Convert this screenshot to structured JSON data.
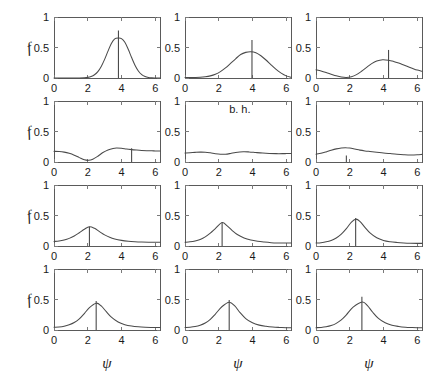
{
  "figure": {
    "width": 436,
    "height": 367,
    "background": "#ffffff",
    "curve_color": "#4a4a4a",
    "frame_color": "#5a5a5a",
    "rows": 4,
    "cols": 3
  },
  "axes": {
    "x_label": "ψ",
    "y_label": "f",
    "x_ticks": [
      0,
      2,
      4,
      6
    ],
    "x_tick_labels": [
      "0",
      "2",
      "4",
      "6"
    ],
    "y_ticks": [
      0,
      0.5,
      1
    ],
    "y_tick_labels": [
      "0",
      "0.5",
      "1"
    ],
    "xlim": [
      0,
      6.2832
    ],
    "ylim": [
      0,
      1
    ]
  },
  "chart_data": {
    "type": "line",
    "title": "",
    "xlabel": "ψ",
    "ylabel": "f",
    "xlim": [
      0,
      6.2832
    ],
    "ylim": [
      0,
      1
    ],
    "grid": false,
    "legend": null,
    "layout": {
      "rows": 4,
      "cols": 3,
      "shared_x": true,
      "shared_y": true
    },
    "panels": [
      {
        "row": 1,
        "col": 1,
        "annotation": "",
        "marker_line": {
          "x": 3.82,
          "y_top": 0.78
        },
        "peak": {
          "x": 3.82,
          "y": 0.655
        },
        "x": [
          0,
          0.3,
          0.6,
          0.9,
          1.2,
          1.5,
          1.8,
          2.0,
          2.2,
          2.4,
          2.6,
          2.8,
          3.0,
          3.2,
          3.4,
          3.6,
          3.82,
          4.0,
          4.2,
          4.4,
          4.6,
          4.8,
          5.0,
          5.2,
          5.4,
          5.6,
          5.8,
          6.0,
          6.2832
        ],
        "y": [
          0.0,
          0.0,
          0.0,
          0.0,
          0.0,
          0.001,
          0.004,
          0.01,
          0.024,
          0.053,
          0.105,
          0.19,
          0.305,
          0.44,
          0.565,
          0.64,
          0.655,
          0.645,
          0.585,
          0.47,
          0.335,
          0.21,
          0.115,
          0.055,
          0.024,
          0.009,
          0.003,
          0.001,
          0.0
        ]
      },
      {
        "row": 1,
        "col": 2,
        "annotation": "",
        "marker_line": {
          "x": 3.97,
          "y_top": 0.625
        },
        "peak": {
          "x": 3.9,
          "y": 0.43
        },
        "x": [
          0,
          0.3,
          0.6,
          0.9,
          1.2,
          1.5,
          1.8,
          2.1,
          2.4,
          2.7,
          3.0,
          3.3,
          3.6,
          3.9,
          4.2,
          4.5,
          4.8,
          5.1,
          5.4,
          5.7,
          6.0,
          6.2832
        ],
        "y": [
          0.008,
          0.008,
          0.009,
          0.012,
          0.02,
          0.035,
          0.062,
          0.105,
          0.165,
          0.24,
          0.315,
          0.385,
          0.42,
          0.43,
          0.415,
          0.365,
          0.295,
          0.215,
          0.14,
          0.08,
          0.035,
          0.014
        ]
      },
      {
        "row": 1,
        "col": 3,
        "annotation": "",
        "marker_line": {
          "x": 4.3,
          "y_top": 0.46
        },
        "peak": {
          "x": 3.95,
          "y": 0.3
        },
        "x": [
          0,
          0.3,
          0.6,
          0.9,
          1.2,
          1.5,
          1.8,
          2.1,
          2.4,
          2.7,
          3.0,
          3.3,
          3.6,
          3.95,
          4.3,
          4.6,
          4.9,
          5.2,
          5.5,
          5.8,
          6.0,
          6.2832
        ],
        "y": [
          0.135,
          0.115,
          0.09,
          0.062,
          0.035,
          0.015,
          0.008,
          0.02,
          0.055,
          0.11,
          0.175,
          0.235,
          0.278,
          0.3,
          0.292,
          0.272,
          0.245,
          0.213,
          0.18,
          0.148,
          0.13,
          0.112
        ]
      },
      {
        "row": 2,
        "col": 1,
        "annotation": "",
        "marker_line": {
          "x": 4.6,
          "y_top": 0.225
        },
        "peak": {
          "x": 3.7,
          "y": 0.228
        },
        "x": [
          0,
          0.3,
          0.6,
          0.9,
          1.2,
          1.5,
          1.8,
          2.05,
          2.3,
          2.6,
          2.9,
          3.2,
          3.5,
          3.7,
          4.0,
          4.3,
          4.6,
          4.9,
          5.2,
          5.5,
          5.8,
          6.0,
          6.2832
        ],
        "y": [
          0.175,
          0.172,
          0.162,
          0.142,
          0.112,
          0.072,
          0.035,
          0.027,
          0.045,
          0.095,
          0.155,
          0.198,
          0.222,
          0.228,
          0.224,
          0.212,
          0.203,
          0.196,
          0.19,
          0.186,
          0.183,
          0.182,
          0.18
        ]
      },
      {
        "row": 2,
        "col": 2,
        "annotation": "b. h.",
        "annotation_x": 3.25,
        "annotation_y": 0.8,
        "marker_line": null,
        "peak": {
          "x": 3.45,
          "y": 0.168
        },
        "x": [
          0,
          0.3,
          0.6,
          0.9,
          1.2,
          1.5,
          1.8,
          2.1,
          2.4,
          2.7,
          3.0,
          3.45,
          3.8,
          4.2,
          4.6,
          5.0,
          5.4,
          5.8,
          6.0,
          6.2832
        ],
        "y": [
          0.148,
          0.152,
          0.158,
          0.162,
          0.16,
          0.15,
          0.136,
          0.127,
          0.128,
          0.14,
          0.156,
          0.168,
          0.165,
          0.155,
          0.146,
          0.14,
          0.137,
          0.137,
          0.138,
          0.14
        ]
      },
      {
        "row": 2,
        "col": 3,
        "annotation": "",
        "marker_line": {
          "x": 1.8,
          "y_top": 0.105
        },
        "peak": {
          "x": 1.75,
          "y": 0.235
        },
        "x": [
          0,
          0.3,
          0.6,
          0.9,
          1.2,
          1.5,
          1.75,
          2.0,
          2.3,
          2.6,
          2.9,
          3.2,
          3.6,
          4.0,
          4.4,
          4.8,
          5.2,
          5.6,
          6.0,
          6.2832
        ],
        "y": [
          0.128,
          0.142,
          0.165,
          0.192,
          0.215,
          0.23,
          0.235,
          0.228,
          0.212,
          0.195,
          0.182,
          0.172,
          0.16,
          0.148,
          0.138,
          0.128,
          0.12,
          0.115,
          0.118,
          0.125
        ]
      },
      {
        "row": 3,
        "col": 1,
        "annotation": "",
        "marker_line": {
          "x": 2.1,
          "y_top": 0.315
        },
        "peak": {
          "x": 2.1,
          "y": 0.315
        },
        "x": [
          0,
          0.3,
          0.6,
          0.9,
          1.2,
          1.5,
          1.8,
          2.1,
          2.4,
          2.7,
          3.0,
          3.3,
          3.6,
          4.0,
          4.4,
          4.8,
          5.2,
          5.6,
          6.0,
          6.2832
        ],
        "y": [
          0.075,
          0.082,
          0.098,
          0.125,
          0.165,
          0.218,
          0.275,
          0.315,
          0.29,
          0.235,
          0.182,
          0.142,
          0.115,
          0.092,
          0.078,
          0.07,
          0.065,
          0.062,
          0.062,
          0.063
        ]
      },
      {
        "row": 3,
        "col": 2,
        "annotation": "",
        "marker_line": {
          "x": 2.2,
          "y_top": 0.385
        },
        "peak": {
          "x": 2.2,
          "y": 0.385
        },
        "x": [
          0,
          0.3,
          0.6,
          0.9,
          1.2,
          1.5,
          1.8,
          2.2,
          2.5,
          2.8,
          3.1,
          3.5,
          3.9,
          4.3,
          4.7,
          5.1,
          5.5,
          5.9,
          6.2832
        ],
        "y": [
          0.062,
          0.068,
          0.082,
          0.108,
          0.15,
          0.21,
          0.285,
          0.385,
          0.33,
          0.253,
          0.188,
          0.132,
          0.098,
          0.078,
          0.065,
          0.055,
          0.05,
          0.048,
          0.048
        ]
      },
      {
        "row": 3,
        "col": 3,
        "annotation": "",
        "marker_line": {
          "x": 2.35,
          "y_top": 0.46
        },
        "peak": {
          "x": 2.35,
          "y": 0.44
        },
        "x": [
          0,
          0.3,
          0.6,
          0.9,
          1.2,
          1.5,
          1.8,
          2.1,
          2.35,
          2.6,
          2.9,
          3.2,
          3.6,
          4.0,
          4.4,
          4.8,
          5.2,
          5.6,
          6.0,
          6.2832
        ],
        "y": [
          0.048,
          0.055,
          0.068,
          0.092,
          0.132,
          0.195,
          0.285,
          0.39,
          0.44,
          0.405,
          0.305,
          0.215,
          0.135,
          0.092,
          0.07,
          0.058,
          0.05,
          0.045,
          0.043,
          0.043
        ]
      },
      {
        "row": 4,
        "col": 1,
        "annotation": "",
        "marker_line": {
          "x": 2.5,
          "y_top": 0.475
        },
        "peak": {
          "x": 2.5,
          "y": 0.44
        },
        "x": [
          0,
          0.3,
          0.6,
          0.9,
          1.2,
          1.5,
          1.8,
          2.1,
          2.5,
          2.8,
          3.1,
          3.4,
          3.8,
          4.2,
          4.6,
          5.0,
          5.4,
          5.8,
          6.2832
        ],
        "y": [
          0.045,
          0.05,
          0.062,
          0.085,
          0.122,
          0.182,
          0.27,
          0.368,
          0.44,
          0.395,
          0.3,
          0.21,
          0.13,
          0.088,
          0.065,
          0.052,
          0.045,
          0.042,
          0.04
        ]
      },
      {
        "row": 4,
        "col": 2,
        "annotation": "",
        "marker_line": {
          "x": 2.62,
          "y_top": 0.49
        },
        "peak": {
          "x": 2.62,
          "y": 0.455
        },
        "x": [
          0,
          0.3,
          0.6,
          0.9,
          1.2,
          1.5,
          1.8,
          2.2,
          2.62,
          2.95,
          3.25,
          3.6,
          4.0,
          4.4,
          4.8,
          5.2,
          5.6,
          6.0,
          6.2832
        ],
        "y": [
          0.04,
          0.045,
          0.056,
          0.078,
          0.115,
          0.175,
          0.262,
          0.385,
          0.455,
          0.395,
          0.29,
          0.188,
          0.118,
          0.08,
          0.06,
          0.048,
          0.042,
          0.038,
          0.037
        ]
      },
      {
        "row": 4,
        "col": 3,
        "annotation": "",
        "marker_line": {
          "x": 2.72,
          "y_top": 0.545
        },
        "peak": {
          "x": 2.75,
          "y": 0.46
        },
        "x": [
          0,
          0.3,
          0.6,
          0.9,
          1.2,
          1.5,
          1.8,
          2.2,
          2.75,
          3.05,
          3.35,
          3.7,
          4.1,
          4.5,
          4.9,
          5.3,
          5.7,
          6.0,
          6.2832
        ],
        "y": [
          0.038,
          0.042,
          0.052,
          0.072,
          0.108,
          0.165,
          0.248,
          0.375,
          0.46,
          0.4,
          0.295,
          0.19,
          0.118,
          0.078,
          0.058,
          0.046,
          0.04,
          0.037,
          0.036
        ]
      }
    ]
  }
}
